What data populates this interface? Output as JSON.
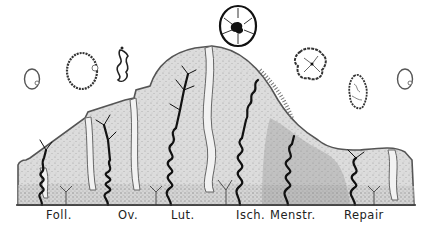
{
  "diagram": {
    "colors": {
      "background": "#ffffff",
      "tissue_fill": "#d9d9d9",
      "tissue_stipple": "#9a9a9a",
      "outline": "#555555",
      "vessel": "#111111",
      "baseline": "#333333"
    },
    "phase_labels": [
      {
        "id": "foll",
        "text": "Foll.",
        "x": 46
      },
      {
        "id": "ov",
        "text": "Ov.",
        "x": 118
      },
      {
        "id": "lut",
        "text": "Lut.",
        "x": 171
      },
      {
        "id": "isch",
        "text": "Isch.",
        "x": 236
      },
      {
        "id": "menstr",
        "text": "Menstr.",
        "x": 270
      },
      {
        "id": "repair",
        "text": "Repair",
        "x": 344
      }
    ],
    "follicle_icons": [
      {
        "id": "follicle-1",
        "shape": "small-ring",
        "cx": 32,
        "cy": 79
      },
      {
        "id": "follicle-2",
        "shape": "large-ring",
        "cx": 82,
        "cy": 71
      },
      {
        "id": "follicle-3",
        "shape": "collapsed",
        "cx": 122,
        "cy": 66
      },
      {
        "id": "corpus-luteum",
        "shape": "rosette-dark-core",
        "cx": 238,
        "cy": 26
      },
      {
        "id": "corpus-regressing",
        "shape": "folded",
        "cx": 312,
        "cy": 64
      },
      {
        "id": "corpus-albicans",
        "shape": "wrinkled",
        "cx": 359,
        "cy": 92
      },
      {
        "id": "follicle-new",
        "shape": "small-ring",
        "cx": 405,
        "cy": 79
      }
    ]
  }
}
